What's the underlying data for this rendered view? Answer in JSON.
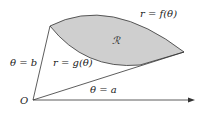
{
  "diagram": {
    "labels": {
      "outer_curve": "r = f(θ)",
      "inner_curve": "r = g(θ)",
      "region": "ℛ",
      "ray_b": "θ = b",
      "ray_a": "θ = a",
      "origin": "O"
    },
    "colors": {
      "region_fill": "#cfcfcf",
      "stroke": "#333333",
      "background": "#ffffff"
    }
  }
}
